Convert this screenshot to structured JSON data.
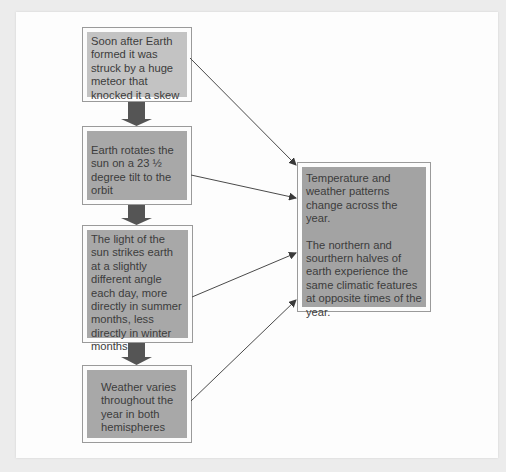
{
  "diagram": {
    "left_column": [
      {
        "id": "cause-meteor",
        "text": "Soon after Earth formed it was struck by a huge meteor that knocked it a skew"
      },
      {
        "id": "cause-tilt",
        "text": "Earth rotates the sun on a 23 ½ degree tilt to the orbit"
      },
      {
        "id": "cause-sunlight-angle",
        "text": "The light of the sun strikes earth at a slightly different angle each day, more directly in summer months, less directly in winter months"
      },
      {
        "id": "cause-weather-varies",
        "text": "Weather varies throughout the year in both hemispheres"
      }
    ],
    "result_box": {
      "paragraph_1": "Temperature and weather patterns change across the year.",
      "paragraph_2": "The northern and sourthern halves of earth experience the same climatic features at opposite times of the year."
    },
    "colors": {
      "box_fill_light": "#c3c3c3",
      "box_fill_dark": "#a8a8a8",
      "block_arrow": "#555555",
      "connector_line": "#4a4a4a",
      "box_border": "#9a9a9a"
    }
  }
}
